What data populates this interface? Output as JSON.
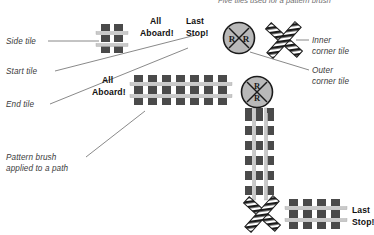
{
  "figure": {
    "top_caption": "Five tiles used for a pattern brush",
    "colors": {
      "tie": "#4a4a4a",
      "tie_dark": "#3a3a3a",
      "rail": "#c9c9c9",
      "rail_edge": "#a8a8a8",
      "sign_fill": "#b9b9b9",
      "sign_stroke": "#1a1a1a",
      "leader": "#6b6b6b",
      "label_text": "#3b3b3b",
      "bold_text": "#111111",
      "stripe_dark": "#1a1a1a",
      "stripe_light": "#ffffff"
    }
  },
  "labels": {
    "side_tile": "Side tile",
    "start_tile": "Start tile",
    "end_tile": "End tile",
    "inner_corner_line1": "Inner",
    "inner_corner_line2": "corner tile",
    "outer_corner_line1": "Outer",
    "outer_corner_line2": "corner tile",
    "pattern_brush_line1": "Pattern brush",
    "pattern_brush_line2": "applied to a path"
  },
  "artwork_text": {
    "all_aboard_top_line1": "All",
    "all_aboard_top_line2": "Aboard!",
    "last_stop_top_line1": "Last",
    "last_stop_top_line2": "Stop!",
    "all_aboard_mid_line1": "All",
    "all_aboard_mid_line2": "Aboard!",
    "last_stop_bottom_line1": "Last",
    "last_stop_bottom_line2": "Stop!",
    "sign_letter": "R"
  }
}
